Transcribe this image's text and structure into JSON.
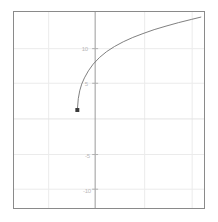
{
  "chart_data": {
    "type": "line",
    "title": "",
    "subtitle": "",
    "xlabel": "",
    "ylabel": "",
    "xlim": [
      -8,
      16
    ],
    "ylim": [
      -12.5,
      12.5
    ],
    "grid": true,
    "legend": null,
    "legend_position": "none",
    "axis_lines": {
      "y_axis_at_x": 0,
      "x_axis_visible": false
    },
    "xticks": [],
    "xtick_labels": [],
    "yticks": [
      10,
      5,
      0,
      -5,
      -10
    ],
    "ytick_labels": [
      "10",
      "5",
      "",
      "-5",
      "-10"
    ],
    "y_gridlines": [
      10,
      5,
      0,
      -5,
      -10
    ],
    "x_gridlines": [
      -4,
      0,
      6,
      12
    ],
    "series": [
      {
        "name": "curve",
        "type": "line",
        "color": "#707070",
        "linewidth": 0.9,
        "x": [
          0.0,
          0.12,
          0.3,
          0.55,
          0.9,
          1.4,
          2.0,
          2.8,
          3.7,
          4.7,
          5.8,
          7.0,
          8.3,
          9.7,
          11.2,
          12.8,
          14.4,
          15.6
        ],
        "y": [
          0.0,
          1.45,
          2.45,
          3.3,
          4.1,
          5.0,
          5.85,
          6.7,
          7.45,
          8.1,
          8.7,
          9.25,
          9.75,
          10.25,
          10.7,
          11.15,
          11.55,
          11.85
        ]
      }
    ],
    "markers": [
      {
        "name": "origin-point",
        "shape": "square",
        "x": 0,
        "y": 0,
        "size": 4,
        "color": "#3a3a3a"
      }
    ],
    "colors": {
      "background": "#ffffff",
      "border": "#8a8a8a",
      "gridline": "#ebebeb",
      "axis_line": "#9a9a9a",
      "curve": "#707070",
      "marker": "#3a3a3a",
      "tick_text": "#bcbcbc"
    }
  }
}
